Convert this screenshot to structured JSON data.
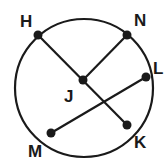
{
  "diagram": {
    "type": "circle-chords",
    "colors": {
      "stroke": "#1a1a1a",
      "background": "#ffffff"
    },
    "circle": {
      "cx": 84,
      "cy": 88,
      "r": 69
    },
    "points": [
      {
        "id": "H",
        "label": "H",
        "x": 38,
        "y": 35,
        "lx": 20,
        "ly": 27
      },
      {
        "id": "N",
        "label": "N",
        "x": 127,
        "y": 35,
        "lx": 134,
        "ly": 26
      },
      {
        "id": "L",
        "label": "L",
        "x": 146,
        "y": 77,
        "lx": 153,
        "ly": 74
      },
      {
        "id": "J",
        "label": "J",
        "x": 83,
        "y": 80,
        "lx": 64,
        "ly": 102
      },
      {
        "id": "K",
        "label": "K",
        "x": 127,
        "y": 125,
        "lx": 134,
        "ly": 148
      },
      {
        "id": "M",
        "label": "M",
        "x": 51,
        "y": 133,
        "lx": 28,
        "ly": 157
      }
    ],
    "segments": [
      {
        "from": "H",
        "to": "K"
      },
      {
        "from": "N",
        "to": "J"
      },
      {
        "from": "L",
        "to": "M"
      },
      {
        "from": "M",
        "to": "K",
        "type": "arc"
      }
    ]
  }
}
